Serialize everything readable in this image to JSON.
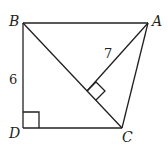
{
  "diagram": {
    "type": "geometry",
    "points": {
      "A": {
        "label": "A"
      },
      "B": {
        "label": "B"
      },
      "C": {
        "label": "C"
      },
      "D": {
        "label": "D"
      }
    },
    "segments": [
      "AB",
      "BD",
      "DC",
      "CA",
      "BC",
      "A-perp-BC"
    ],
    "measures": {
      "BD": "6",
      "perpendicular_from_A": "7"
    },
    "right_angles": [
      "D",
      "foot of perpendicular from A to BC"
    ]
  }
}
